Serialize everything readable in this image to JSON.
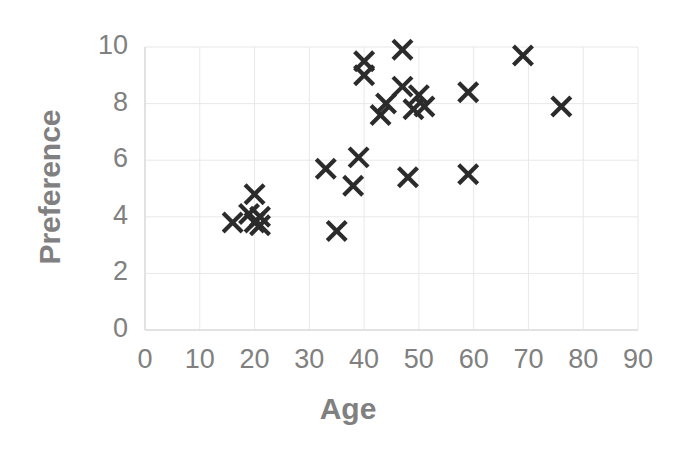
{
  "chart_data": {
    "type": "scatter",
    "title": "",
    "xlabel": "Age",
    "ylabel": "Preference",
    "xlim": [
      0,
      90
    ],
    "ylim": [
      0,
      10
    ],
    "xticks": [
      0,
      10,
      20,
      30,
      40,
      50,
      60,
      70,
      80,
      90
    ],
    "yticks": [
      0,
      2,
      4,
      6,
      8,
      10
    ],
    "xtick_labels": [
      "0",
      "10",
      "20",
      "30",
      "40",
      "50",
      "60",
      "70",
      "80",
      "90"
    ],
    "ytick_labels": [
      "0",
      "2",
      "4",
      "6",
      "8",
      "10"
    ],
    "grid": true,
    "legend": false,
    "marker": "x",
    "marker_color": "#2b2b2b",
    "axis_label_color": "#808080",
    "tick_label_color": "#808080",
    "grid_color": "#e8e8e8",
    "background_color": "#ffffff",
    "points": [
      {
        "x": 16,
        "y": 3.8
      },
      {
        "x": 19,
        "y": 4.1
      },
      {
        "x": 20,
        "y": 4.8
      },
      {
        "x": 20,
        "y": 3.8
      },
      {
        "x": 21,
        "y": 4.0
      },
      {
        "x": 21,
        "y": 3.7
      },
      {
        "x": 33,
        "y": 5.7
      },
      {
        "x": 35,
        "y": 3.5
      },
      {
        "x": 38,
        "y": 5.1
      },
      {
        "x": 39,
        "y": 6.1
      },
      {
        "x": 40,
        "y": 9.5
      },
      {
        "x": 40,
        "y": 9.0
      },
      {
        "x": 43,
        "y": 7.6
      },
      {
        "x": 47,
        "y": 9.9
      },
      {
        "x": 47,
        "y": 8.6
      },
      {
        "x": 48,
        "y": 5.4
      },
      {
        "x": 49,
        "y": 7.8
      },
      {
        "x": 50,
        "y": 8.3
      },
      {
        "x": 51,
        "y": 7.9
      },
      {
        "x": 59,
        "y": 8.4
      },
      {
        "x": 59,
        "y": 5.5
      },
      {
        "x": 69,
        "y": 9.7
      },
      {
        "x": 76,
        "y": 7.9
      },
      {
        "x": 44,
        "y": 8.0
      }
    ]
  },
  "labels": {
    "x_axis_title": "Age",
    "y_axis_title": "Preference"
  }
}
